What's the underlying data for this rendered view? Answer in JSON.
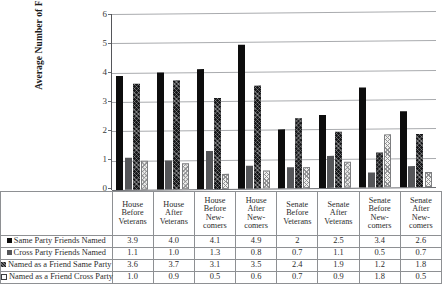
{
  "chart_data": {
    "type": "bar",
    "title": "",
    "xlabel": "",
    "ylabel": "Average Number of Friends",
    "ylim": [
      0,
      6
    ],
    "yticks": [
      "0",
      "1",
      "2",
      "3",
      "4",
      "5",
      "6"
    ],
    "grid": true,
    "legend_position": "table-left",
    "categories": [
      "House Before Veterans",
      "House After Veterans",
      "House Before New-comers",
      "House After New-comers",
      "Senate Before Veterans",
      "Senate After Veterans",
      "Senate Before New-comers",
      "Senate After New-comers"
    ],
    "category_lines": [
      [
        "House",
        "Before",
        "Veterans"
      ],
      [
        "House",
        "After",
        "Veterans"
      ],
      [
        "House",
        "Before",
        "New-",
        "comers"
      ],
      [
        "House",
        "After",
        "New-",
        "comers"
      ],
      [
        "Senate",
        "Before",
        "Veterans"
      ],
      [
        "Senate",
        "After",
        "Veterans"
      ],
      [
        "Senate",
        "Before",
        "New-",
        "comers"
      ],
      [
        "Senate",
        "After",
        "New-",
        "comers"
      ]
    ],
    "series": [
      {
        "name": "Same Party Friends Named",
        "swatch": "solid-black",
        "values": [
          3.9,
          4.0,
          4.1,
          4.9,
          2,
          2.5,
          3.4,
          2.6
        ],
        "labels": [
          "3.9",
          "4.0",
          "4.1",
          "4.9",
          "2",
          "2.5",
          "3.4",
          "2.6"
        ]
      },
      {
        "name": "Cross Party Friends Named",
        "swatch": "solid-gray",
        "values": [
          1.1,
          1.0,
          1.3,
          0.8,
          0.7,
          1.1,
          0.5,
          0.7
        ],
        "labels": [
          "1.1",
          "1.0",
          "1.3",
          "0.8",
          "0.7",
          "1.1",
          "0.5",
          "0.7"
        ]
      },
      {
        "name": "Named as a Friend Same Party",
        "swatch": "hatched-dark",
        "values": [
          3.6,
          3.7,
          3.1,
          3.5,
          2.4,
          1.9,
          1.2,
          1.8
        ],
        "labels": [
          "3.6",
          "3.7",
          "3.1",
          "3.5",
          "2.4",
          "1.9",
          "1.2",
          "1.8"
        ]
      },
      {
        "name": "Named as a Friend Cross Party",
        "swatch": "dotted-light",
        "values": [
          1.0,
          0.9,
          0.5,
          0.6,
          0.7,
          0.9,
          1.8,
          0.5
        ],
        "labels": [
          "1.0",
          "0.9",
          "0.5",
          "0.6",
          "0.7",
          "0.9",
          "1.8",
          "0.5"
        ]
      }
    ]
  }
}
